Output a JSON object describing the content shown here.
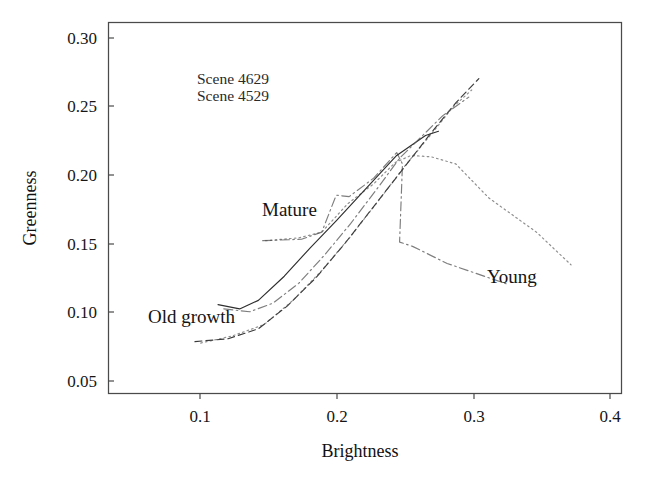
{
  "figure": {
    "background": "#ffffff",
    "ink_color": "#2e2e2e"
  },
  "chart_data": {
    "type": "line",
    "title": "",
    "subtitle": "",
    "xlabel": "Brightness",
    "ylabel": "Greenness",
    "xlim": [
      0.048,
      0.404
    ],
    "ylim": [
      0.0445,
      0.3055
    ],
    "xticks": [
      "0.1",
      "0.2",
      "0.3",
      "0.4"
    ],
    "xtick_values": [
      0.1,
      0.2,
      0.3,
      0.4
    ],
    "yticks": [
      "0.05",
      "0.10",
      "0.15",
      "0.20",
      "0.25",
      "0.30"
    ],
    "ytick_values": [
      0.05,
      0.1,
      0.15,
      0.2,
      0.25,
      0.3
    ],
    "grid": false,
    "legend_position": "inside-upper-left",
    "legend_entries": [
      "Scene 4629",
      "Scene 4529"
    ],
    "annotations": [
      {
        "text": "Old growth",
        "x": 0.105,
        "y": 0.1055,
        "anchor": "start"
      },
      {
        "text": "Mature",
        "x": 0.182,
        "y": 0.178,
        "anchor": "start"
      },
      {
        "text": "Young",
        "x": 0.307,
        "y": 0.1345,
        "anchor": "start"
      }
    ],
    "series": [
      {
        "name": "Scene 4629 - trajectory A",
        "style": "dashdot",
        "x": [
          0.155,
          0.182,
          0.196,
          0.206,
          0.215,
          0.232,
          0.248,
          0.252,
          0.25,
          0.259,
          0.283,
          0.326
        ],
        "y": [
          0.152,
          0.153,
          0.158,
          0.184,
          0.183,
          0.196,
          0.214,
          0.206,
          0.151,
          0.148,
          0.136,
          0.121
        ]
      },
      {
        "name": "Scene 4629 - trajectory B",
        "style": "dotted",
        "x": [
          0.157,
          0.18,
          0.196,
          0.214,
          0.232,
          0.247,
          0.258,
          0.272,
          0.289,
          0.312,
          0.345,
          0.369
        ],
        "y": [
          0.152,
          0.154,
          0.158,
          0.178,
          0.192,
          0.207,
          0.212,
          0.211,
          0.206,
          0.182,
          0.158,
          0.135
        ]
      },
      {
        "name": "Scene 4529 - trajectory A",
        "style": "solid",
        "x": [
          0.124,
          0.139,
          0.152,
          0.17,
          0.188,
          0.206,
          0.226,
          0.248,
          0.268,
          0.277
        ],
        "y": [
          0.107,
          0.104,
          0.11,
          0.127,
          0.147,
          0.166,
          0.188,
          0.212,
          0.226,
          0.229
        ]
      },
      {
        "name": "Scene 4529 - trajectory B",
        "style": "dashed",
        "x": [
          0.108,
          0.131,
          0.152,
          0.172,
          0.192,
          0.212,
          0.232,
          0.252,
          0.272,
          0.289,
          0.305
        ],
        "y": [
          0.081,
          0.083,
          0.09,
          0.106,
          0.126,
          0.15,
          0.176,
          0.202,
          0.228,
          0.249,
          0.266
        ]
      },
      {
        "name": "Scene 4529 - trajectory C",
        "style": "dotted",
        "x": [
          0.112,
          0.134,
          0.156,
          0.176,
          0.196,
          0.216,
          0.236,
          0.254,
          0.272,
          0.287,
          0.3
        ],
        "y": [
          0.08,
          0.085,
          0.093,
          0.11,
          0.131,
          0.155,
          0.181,
          0.205,
          0.227,
          0.246,
          0.258
        ]
      },
      {
        "name": "Scene 4529 - trajectory D",
        "style": "dashdot",
        "x": [
          0.128,
          0.146,
          0.162,
          0.18,
          0.198,
          0.216,
          0.234,
          0.25,
          0.262,
          0.28,
          0.298
        ],
        "y": [
          0.104,
          0.102,
          0.108,
          0.122,
          0.142,
          0.164,
          0.188,
          0.21,
          0.222,
          0.24,
          0.253
        ]
      }
    ]
  },
  "axes": {
    "x_title": "Brightness",
    "y_title": "Greenness"
  },
  "legend": {
    "line1": "Scene 4629",
    "line2": "Scene 4529"
  },
  "labels": {
    "old_growth": "Old growth",
    "mature": "Mature",
    "young": "Young"
  },
  "ticks": {
    "x": [
      "0.1",
      "0.2",
      "0.3",
      "0.4"
    ],
    "y": [
      "0.30",
      "0.25",
      "0.20",
      "0.15",
      "0.10",
      "0.05"
    ]
  }
}
